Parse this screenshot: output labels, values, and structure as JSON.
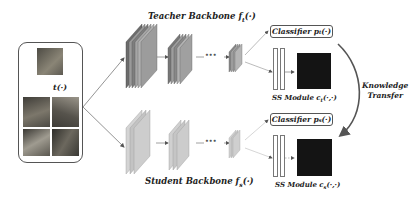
{
  "diagram": {
    "input": {
      "transform_label": "t(·)",
      "images": [
        "original-image",
        "augmented-image-1",
        "augmented-image-2",
        "augmented-image-3",
        "augmented-image-4"
      ]
    },
    "teacher": {
      "title": "Teacher Backbone f",
      "title_sub": "t",
      "title_suffix": "(·)",
      "classifier_label": "Classifier p",
      "classifier_sub": "t",
      "classifier_suffix": "(·)",
      "ss_module_label": "SS Module c",
      "ss_module_sub": "t",
      "ss_module_suffix": "(·,·)",
      "ellipsis": "•••"
    },
    "student": {
      "title": "Student Backbone f",
      "title_sub": "s",
      "title_suffix": "(·)",
      "classifier_label": "Classifier p",
      "classifier_sub": "s",
      "classifier_suffix": "(·)",
      "ss_module_label": "SS Module c",
      "ss_module_sub": "s",
      "ss_module_suffix": "(·,·)",
      "ellipsis": "•••"
    },
    "transfer": {
      "line1": "Knowledge",
      "line2": "Transfer"
    },
    "colors": {
      "teacher_layer": "#8f8f8f",
      "student_layer": "#c4c4c4",
      "matrix": "#141414",
      "arrow": "#666666"
    }
  }
}
